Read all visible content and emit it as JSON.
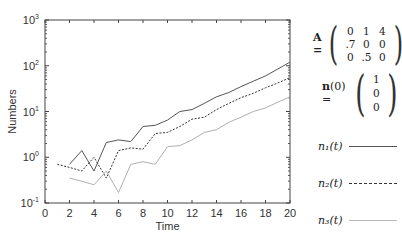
{
  "chart_data": {
    "type": "line",
    "title": "",
    "xlabel": "Time",
    "ylabel": "Numbers",
    "yscale": "log",
    "xlim": [
      0,
      20
    ],
    "ylim": [
      0.1,
      1000
    ],
    "x_ticks": [
      "0",
      "2",
      "4",
      "6",
      "8",
      "10",
      "12",
      "14",
      "16",
      "18",
      "20"
    ],
    "y_ticks": [
      "10^-1",
      "10^0",
      "10^1",
      "10^2",
      "10^3"
    ],
    "grid": false,
    "legend_position": "right",
    "series": [
      {
        "name": "n1(t)",
        "style": "solid",
        "color": "#555555",
        "x": [
          2,
          3,
          4,
          5,
          6,
          7,
          8,
          9,
          10,
          11,
          12,
          13,
          14,
          15,
          16,
          17,
          18,
          19,
          20
        ],
        "values": [
          0.7,
          1.4,
          0.5,
          2.1,
          2.4,
          2.2,
          4.7,
          5.0,
          6.5,
          10,
          11,
          15,
          21,
          26,
          35,
          46,
          60,
          85,
          120
        ]
      },
      {
        "name": "n2(t)",
        "style": "dashed",
        "color": "#333333",
        "x": [
          1,
          2,
          3,
          4,
          5,
          6,
          7,
          8,
          9,
          10,
          11,
          12,
          13,
          14,
          15,
          16,
          17,
          18,
          19,
          20
        ],
        "values": [
          0.7,
          0.6,
          0.5,
          1.0,
          0.35,
          1.4,
          1.6,
          1.5,
          3.3,
          3.5,
          4.7,
          6.8,
          7.5,
          11,
          15,
          20,
          25,
          33,
          42,
          55
        ]
      },
      {
        "name": "n3(t)",
        "style": "solid-light",
        "color": "#b0b0b0",
        "x": [
          2,
          3,
          4,
          5,
          6,
          7,
          8,
          9,
          10,
          11,
          12,
          13,
          14,
          15,
          16,
          17,
          18,
          19,
          20
        ],
        "values": [
          0.35,
          0.3,
          0.25,
          0.5,
          0.17,
          0.7,
          0.8,
          0.7,
          1.7,
          1.8,
          2.4,
          3.5,
          4.0,
          5.8,
          7.5,
          10,
          12,
          16,
          21
        ]
      }
    ]
  },
  "side": {
    "matrix_label": "A =",
    "matrix": [
      [
        "0",
        "1",
        "4"
      ],
      [
        ".7",
        "0",
        "0"
      ],
      [
        "0",
        ".5",
        "0"
      ]
    ],
    "vector_label": "n(0) =",
    "vector": [
      "1",
      "0",
      "0"
    ],
    "legend": [
      "n₁(t)",
      "n₂(t)",
      "n₃(t)"
    ]
  }
}
